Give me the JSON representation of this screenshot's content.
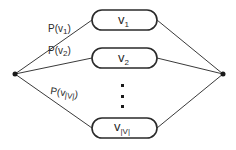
{
  "diagram": {
    "type": "branching-graph",
    "colors": {
      "stroke": "#3a3a3a",
      "text": "#2a2a2a",
      "background": "#ffffff"
    },
    "source_node": {
      "x": 15,
      "y": 74
    },
    "sink_node": {
      "x": 223,
      "y": 74
    },
    "ellipsis": "⋮",
    "nodes": [
      {
        "id": "v1",
        "base": "v",
        "subscript": "1",
        "edge_label": "P(v",
        "edge_sub": "1",
        "edge_close": ")",
        "cy": 20
      },
      {
        "id": "v2",
        "base": "v",
        "subscript": "2",
        "edge_label": "P(v",
        "edge_sub": "2",
        "edge_close": ")",
        "cy": 58
      },
      {
        "id": "vV",
        "base": "v",
        "subscript": "|V|",
        "edge_label": "P(v",
        "edge_sub": "|V|",
        "edge_close": ")",
        "cy": 128
      }
    ]
  }
}
